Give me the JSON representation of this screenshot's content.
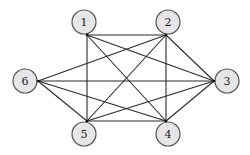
{
  "diagram": {
    "type": "graph",
    "directed": false,
    "colors": {
      "node_fill": "#e6e6e6",
      "node_stroke": "#555555",
      "edge": "#2a2a2a",
      "background": "#ffffff"
    },
    "nodes": [
      {
        "id": "1",
        "label": "1",
        "cx": 84,
        "cy": 22,
        "r": 12,
        "ax": 87,
        "ay": 35
      },
      {
        "id": "2",
        "label": "2",
        "cx": 168,
        "cy": 22,
        "r": 12,
        "ax": 166,
        "ay": 35
      },
      {
        "id": "3",
        "label": "3",
        "cx": 227,
        "cy": 81,
        "r": 12,
        "ax": 214,
        "ay": 81
      },
      {
        "id": "4",
        "label": "4",
        "cx": 168,
        "cy": 134,
        "r": 12,
        "ax": 166,
        "ay": 121
      },
      {
        "id": "5",
        "label": "5",
        "cx": 84,
        "cy": 134,
        "r": 12,
        "ax": 87,
        "ay": 121
      },
      {
        "id": "6",
        "label": "6",
        "cx": 25,
        "cy": 81,
        "r": 12,
        "ax": 38,
        "ay": 81
      }
    ],
    "edges": [
      [
        "1",
        "2"
      ],
      [
        "1",
        "3"
      ],
      [
        "1",
        "4"
      ],
      [
        "1",
        "5"
      ],
      [
        "2",
        "3"
      ],
      [
        "2",
        "4"
      ],
      [
        "2",
        "5"
      ],
      [
        "2",
        "6"
      ],
      [
        "3",
        "4"
      ],
      [
        "3",
        "5"
      ],
      [
        "3",
        "6"
      ],
      [
        "4",
        "5"
      ],
      [
        "4",
        "6"
      ],
      [
        "5",
        "6"
      ]
    ]
  }
}
